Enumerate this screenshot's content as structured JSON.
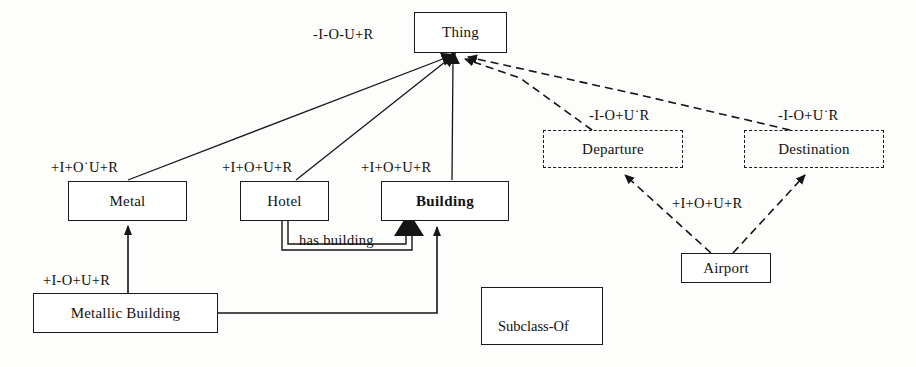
{
  "diagram": {
    "colors": {
      "stroke": "#1a1a1a",
      "text": "#101010",
      "background": "#fdfdfc"
    },
    "nodes": [
      {
        "id": "thing",
        "label": "Thing",
        "style": "solid",
        "bold": false,
        "x": 414,
        "y": 12,
        "w": 93,
        "h": 41
      },
      {
        "id": "metal",
        "label": "Metal",
        "style": "solid",
        "bold": false,
        "x": 68,
        "y": 181,
        "w": 119,
        "h": 40
      },
      {
        "id": "hotel",
        "label": "Hotel",
        "style": "solid",
        "bold": false,
        "x": 240,
        "y": 181,
        "w": 89,
        "h": 40
      },
      {
        "id": "building",
        "label": "Building",
        "style": "solid",
        "bold": true,
        "x": 381,
        "y": 181,
        "w": 128,
        "h": 40
      },
      {
        "id": "metallic-building",
        "label": "Metallic Building",
        "style": "solid",
        "bold": false,
        "x": 33,
        "y": 293,
        "w": 185,
        "h": 40
      },
      {
        "id": "departure",
        "label": "Departure",
        "style": "dashed",
        "bold": false,
        "x": 543,
        "y": 130,
        "w": 140,
        "h": 38
      },
      {
        "id": "destination",
        "label": "Destination",
        "style": "dashed",
        "bold": false,
        "x": 744,
        "y": 130,
        "w": 140,
        "h": 38
      },
      {
        "id": "airport",
        "label": "Airport",
        "style": "solid",
        "bold": false,
        "x": 681,
        "y": 253,
        "w": 90,
        "h": 30
      }
    ],
    "edge_labels": [
      {
        "id": "thing-label",
        "text": "-I-O-U+R",
        "x": 313,
        "y": 26
      },
      {
        "id": "metal-label",
        "text": "+I+O˙U+R",
        "x": 51,
        "y": 159
      },
      {
        "id": "hotel-label",
        "text": "+I+O+U+R",
        "x": 222,
        "y": 159
      },
      {
        "id": "building-label",
        "text": "+I+O+U+R",
        "x": 361,
        "y": 159
      },
      {
        "id": "metallic-label",
        "text": "+I-O+U+R",
        "x": 43,
        "y": 272
      },
      {
        "id": "departure-label",
        "text": "-I-O+U˙R",
        "x": 589,
        "y": 107
      },
      {
        "id": "destination-label",
        "text": "-I-O+U˙R",
        "x": 778,
        "y": 107
      },
      {
        "id": "airport-label",
        "text": "+I+O+U+R",
        "x": 672,
        "y": 195
      },
      {
        "id": "has-building-label",
        "text": "has building",
        "x": 299,
        "y": 232
      }
    ],
    "legend": {
      "caption": "Subclass-Of",
      "arrow_name": "subclass-of-arrow",
      "x": 481,
      "y": 287,
      "w": 122,
      "h": 58
    },
    "relations": [
      {
        "from": "metal",
        "to": "thing",
        "kind": "subclass-of",
        "line": "solid"
      },
      {
        "from": "hotel",
        "to": "thing",
        "kind": "subclass-of",
        "line": "solid"
      },
      {
        "from": "building",
        "to": "thing",
        "kind": "subclass-of",
        "line": "solid"
      },
      {
        "from": "metallic-building",
        "to": "metal",
        "kind": "subclass-of",
        "line": "solid"
      },
      {
        "from": "metallic-building",
        "to": "building",
        "kind": "subclass-of",
        "line": "solid"
      },
      {
        "from": "hotel",
        "to": "building",
        "kind": "has building",
        "line": "double"
      },
      {
        "from": "departure",
        "to": "thing",
        "kind": "subclass-of",
        "line": "dashed"
      },
      {
        "from": "destination",
        "to": "thing",
        "kind": "subclass-of",
        "line": "dashed"
      },
      {
        "from": "airport",
        "to": "departure",
        "kind": "subclass-of",
        "line": "dashed"
      },
      {
        "from": "airport",
        "to": "destination",
        "kind": "subclass-of",
        "line": "dashed"
      }
    ]
  }
}
